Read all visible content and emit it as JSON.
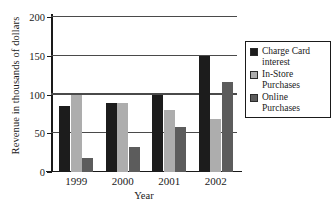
{
  "chart_data": {
    "type": "bar",
    "title": "",
    "xlabel": "Year",
    "ylabel": "Revenue in thousands of dollars",
    "categories": [
      "1999",
      "2000",
      "2001",
      "2002"
    ],
    "series": [
      {
        "name": "Charge Card interest",
        "color": "#1c1c1c",
        "values": [
          85,
          89,
          99,
          150
        ]
      },
      {
        "name": "In-Store Purchases",
        "color": "#adadad",
        "values": [
          100,
          89,
          80,
          68
        ]
      },
      {
        "name": "Online Purchases",
        "color": "#5c5c5c",
        "values": [
          18,
          32,
          58,
          116
        ]
      }
    ],
    "ylim": [
      0,
      200
    ],
    "yticks": [
      0,
      50,
      100,
      150,
      200
    ],
    "ytick_labels": [
      "0",
      "50",
      "100",
      "150",
      "200"
    ],
    "grid": true,
    "legend_position": "right",
    "legend_entries": [
      {
        "label_line1": "Charge Card",
        "label_line2": "interest"
      },
      {
        "label_line1": "In-Store",
        "label_line2": "Purchases"
      },
      {
        "label_line1": "Online",
        "label_line2": "Purchases"
      }
    ]
  }
}
